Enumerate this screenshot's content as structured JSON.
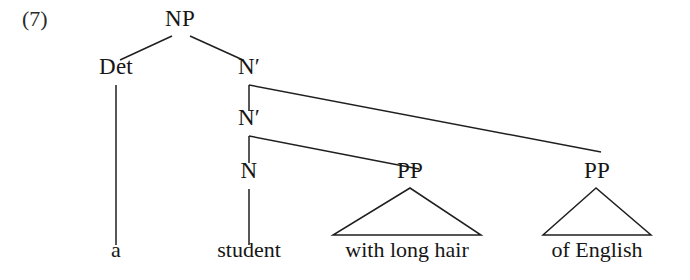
{
  "figure": {
    "example_number": "(7)",
    "example_number_pos": {
      "x": 22,
      "y": 30
    },
    "width": 690,
    "height": 280,
    "background_color": "#ffffff",
    "line_color": "#1f1f1f",
    "text_color": "#161616"
  },
  "nodes": [
    {
      "id": "np",
      "label": "NP",
      "x": 180,
      "y": 30
    },
    {
      "id": "det",
      "label": "Det",
      "x": 116,
      "y": 78
    },
    {
      "id": "nbar1",
      "label": "N′",
      "x": 249,
      "y": 78
    },
    {
      "id": "nbar2",
      "label": "N′",
      "x": 249,
      "y": 129
    },
    {
      "id": "n",
      "label": "N",
      "x": 249,
      "y": 182
    },
    {
      "id": "pp1",
      "label": "PP",
      "x": 410,
      "y": 182
    },
    {
      "id": "pp2",
      "label": "PP",
      "x": 597,
      "y": 182
    }
  ],
  "terminals": [
    {
      "id": "a",
      "label": "a",
      "x": 116,
      "y": 261
    },
    {
      "id": "student",
      "label": "student",
      "x": 249,
      "y": 261
    },
    {
      "id": "phrase1",
      "label": "with long hair",
      "x": 407,
      "y": 261
    },
    {
      "id": "phrase2",
      "label": "of English",
      "x": 597,
      "y": 261
    }
  ],
  "edges": [
    {
      "id": "np-det",
      "from": "np",
      "to": "det",
      "x1": 172,
      "y1": 36,
      "x2": 120,
      "y2": 60
    },
    {
      "id": "np-nbar1",
      "from": "np",
      "to": "nbar1",
      "x1": 190,
      "y1": 36,
      "x2": 243,
      "y2": 60
    },
    {
      "id": "det-a",
      "from": "det",
      "to": "a",
      "x1": 116,
      "y1": 85,
      "x2": 116,
      "y2": 245
    },
    {
      "id": "nbar1-stub",
      "from": "nbar1",
      "to": "junction1",
      "x1": 249,
      "y1": 85,
      "x2": 249,
      "y2": 111
    },
    {
      "id": "nbar1-pp2",
      "from": "nbar1",
      "to": "pp2",
      "x1": 249,
      "y1": 85,
      "x2": 601,
      "y2": 152
    },
    {
      "id": "nbar2-stub",
      "from": "nbar2",
      "to": "junction2",
      "x1": 249,
      "y1": 136,
      "x2": 249,
      "y2": 163
    },
    {
      "id": "nbar2-pp1",
      "from": "nbar2",
      "to": "pp1",
      "x1": 249,
      "y1": 136,
      "x2": 419,
      "y2": 169
    },
    {
      "id": "n-student",
      "from": "n",
      "to": "student",
      "x1": 249,
      "y1": 189,
      "x2": 249,
      "y2": 245
    }
  ],
  "triangles": [
    {
      "id": "triangle-pp1",
      "apex_x": 410,
      "apex_y": 188,
      "left_x": 333,
      "right_x": 481,
      "base_y": 235
    },
    {
      "id": "triangle-pp2",
      "apex_x": 596,
      "apex_y": 188,
      "left_x": 543,
      "right_x": 651,
      "base_y": 235
    }
  ],
  "tree_structure": {
    "root": "NP",
    "description": "NP → Det N′ ; N′ → N′ PP(of English) ; N′ → N PP(with long hair) ; N → student ; Det → a",
    "sentence": "a student with long hair of English"
  }
}
